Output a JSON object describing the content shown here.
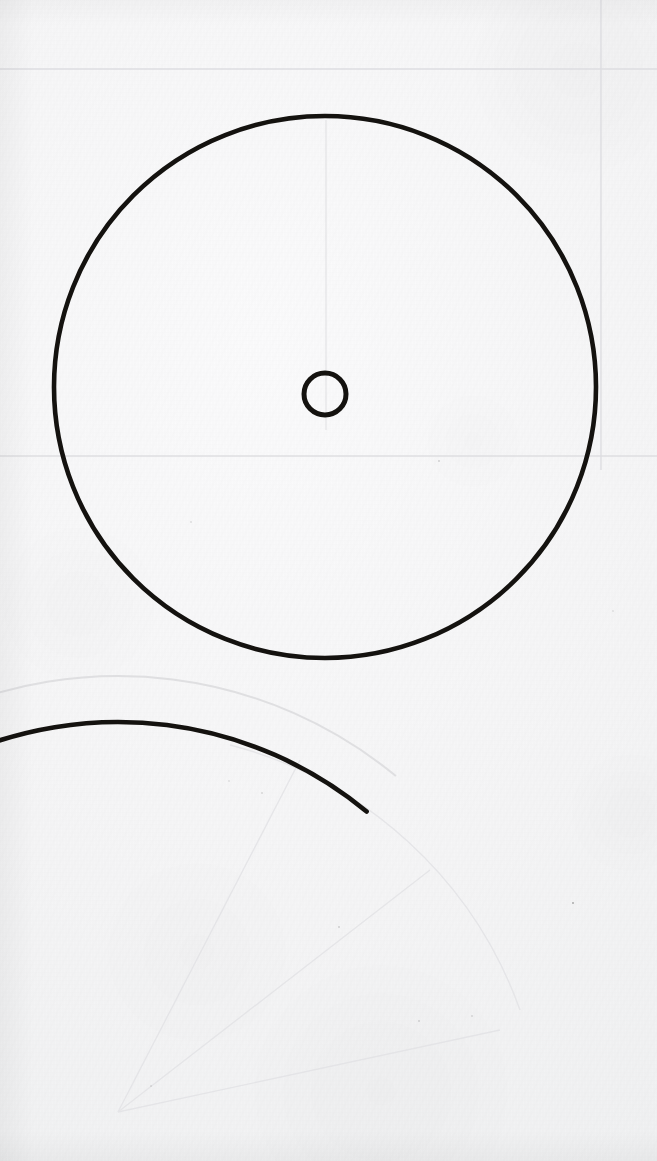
{
  "document": {
    "kind": "scanned-technical-drawing",
    "medium": "paper-scan",
    "sheet": {
      "width": 657,
      "height": 1161
    },
    "background_color": "#f7f7f8",
    "ink_color": "#14120f",
    "faint_line_color": "#dedee1",
    "visible_text": []
  },
  "geometry": {
    "upper_circle": {
      "label": "upper-circle",
      "cx": 325,
      "cy": 387,
      "r": 272,
      "stroke_width": 4.6,
      "complete": true
    },
    "center_circle": {
      "label": "center-hub-circle",
      "cx": 325,
      "cy": 394,
      "r": 21,
      "stroke_width": 5.0,
      "complete": true
    },
    "lower_circle": {
      "label": "lower-circle-arc",
      "cx": 118,
      "cy": 1112,
      "r": 390,
      "stroke_width": 4.6,
      "complete": false,
      "note": "only upper-right quadrant inside sheet"
    },
    "lower_circle_ghost": {
      "label": "lower-circle-ghost-arc",
      "cx": 118,
      "cy": 1112,
      "r": 436,
      "stroke_width": 2.0
    },
    "construction_lines": [
      {
        "label": "horizontal-upper",
        "orientation": "horizontal",
        "position": 69
      },
      {
        "label": "horizontal-lower",
        "orientation": "horizontal",
        "position": 456
      },
      {
        "label": "vertical-right",
        "orientation": "vertical",
        "position": 601
      },
      {
        "label": "vertical-center",
        "orientation": "vertical",
        "position": 326
      }
    ]
  },
  "chart_data": {
    "type": "scatter",
    "title": "",
    "xlabel": "",
    "ylabel": "",
    "xlim": [
      0,
      657
    ],
    "ylim": [
      0,
      1161
    ],
    "grid": false,
    "legend": "none",
    "series": [
      {
        "name": "upper-circle",
        "shape": "circle",
        "center": [
          325,
          387
        ],
        "radius": 272,
        "diameter": 544
      },
      {
        "name": "center-hub-circle",
        "shape": "circle",
        "center": [
          325,
          394
        ],
        "radius": 21,
        "diameter": 42
      },
      {
        "name": "lower-circle-arc",
        "shape": "circle",
        "center": [
          118,
          1112
        ],
        "radius": 390,
        "diameter": 780
      }
    ],
    "annotations": []
  }
}
